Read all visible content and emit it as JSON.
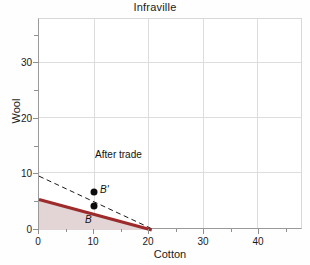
{
  "chart_data": {
    "type": "line",
    "title": "Infraville",
    "xlabel": "Cotton",
    "ylabel": "Wool",
    "xlim": [
      0,
      48
    ],
    "ylim": [
      0,
      38
    ],
    "grid": true,
    "legend": null,
    "x_major_ticks": [
      0,
      10,
      20,
      30,
      40
    ],
    "x_minor_ticks": [
      5,
      15,
      25,
      35,
      45
    ],
    "y_major_ticks": [
      0,
      10,
      20,
      30
    ],
    "y_minor_ticks": [
      5,
      15,
      25,
      35
    ],
    "x_tick_labels": [
      "0",
      "10",
      "20",
      "30",
      "40"
    ],
    "y_tick_labels": [
      "0",
      "10",
      "20",
      "30"
    ],
    "series": [
      {
        "name": "production-possibility-frontier",
        "style": "solid",
        "color": "#9e2b2b",
        "x": [
          0,
          20.5
        ],
        "values": [
          5.5,
          0
        ]
      },
      {
        "name": "after-trade-consumption-line",
        "style": "dashed",
        "color": "#1a1a1a",
        "x": [
          0,
          21.0
        ],
        "values": [
          9.7,
          0
        ]
      }
    ],
    "shaded_region": {
      "name": "feasible-production-set",
      "color": "#e3d5d5",
      "under_series": "production-possibility-frontier"
    },
    "points": [
      {
        "name": "point-b-prime",
        "label": "B'",
        "x": 10,
        "y": 5.3
      },
      {
        "name": "point-b",
        "label": "B",
        "x": 10,
        "y": 2.8
      }
    ],
    "annotations": [
      {
        "name": "after-trade-label",
        "text": "After trade",
        "x": 10.2,
        "y": 12.3
      }
    ]
  }
}
